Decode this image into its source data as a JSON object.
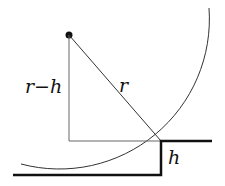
{
  "diagram": {
    "labels": {
      "radius": "r",
      "vertical_leg": "r−h",
      "step_height": "h"
    },
    "colors": {
      "thin_line": "#555555",
      "thick_line": "#111111",
      "background": "#ffffff"
    }
  }
}
